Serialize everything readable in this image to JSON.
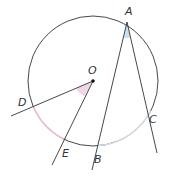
{
  "diagram": {
    "labels": {
      "A": "A",
      "B": "B",
      "C": "C",
      "D": "D",
      "E": "E",
      "O": "O"
    },
    "colors": {
      "stroke": "#333333",
      "arc_DE": "#e8c4d8",
      "arc_BC": "#d6dde6",
      "angle_A_fill": "#c9def0",
      "angle_O_fill": "#f2d6e8"
    }
  }
}
